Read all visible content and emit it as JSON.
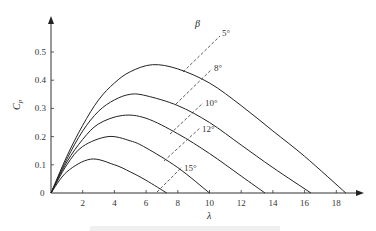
{
  "chart_data": {
    "type": "line",
    "title": "",
    "xlabel": "λ",
    "ylabel": "Cp",
    "xlim": [
      0,
      19.5
    ],
    "ylim": [
      0,
      0.58
    ],
    "grid": false,
    "x_ticks": [
      2,
      4,
      6,
      8,
      10,
      12,
      14,
      16,
      18
    ],
    "x_tick_labels": [
      "2",
      "4",
      "6",
      "8",
      "10",
      "12",
      "14",
      "16",
      "18"
    ],
    "y_ticks": [
      0,
      0.1,
      0.2,
      0.3,
      0.4,
      0.5
    ],
    "y_tick_labels": [
      "0",
      "0.1",
      "0.2",
      "0.3",
      "0.4",
      "0.5"
    ],
    "legend_title": "β",
    "series": [
      {
        "name": "5°",
        "pitch_angle_deg": 5,
        "peak": {
          "x": 6.4,
          "y": 0.455
        },
        "end_x": 18.6,
        "x": [
          0,
          1,
          2,
          3,
          4,
          5,
          6.4,
          8,
          10,
          12,
          14,
          16,
          18.6
        ],
        "values": [
          0,
          0.13,
          0.24,
          0.33,
          0.39,
          0.43,
          0.455,
          0.44,
          0.39,
          0.31,
          0.22,
          0.13,
          0
        ]
      },
      {
        "name": "8°",
        "pitch_angle_deg": 8,
        "peak": {
          "x": 5.0,
          "y": 0.35
        },
        "end_x": 16.4,
        "x": [
          0,
          1,
          2,
          3,
          4,
          5,
          6,
          8,
          10,
          12,
          14,
          16.4
        ],
        "values": [
          0,
          0.12,
          0.22,
          0.29,
          0.33,
          0.35,
          0.345,
          0.31,
          0.25,
          0.17,
          0.09,
          0
        ]
      },
      {
        "name": "10°",
        "pitch_angle_deg": 10,
        "peak": {
          "x": 4.5,
          "y": 0.275
        },
        "end_x": 13.5,
        "x": [
          0,
          1,
          2,
          3,
          4.5,
          6,
          8,
          10,
          12,
          13.5
        ],
        "values": [
          0,
          0.11,
          0.19,
          0.245,
          0.275,
          0.265,
          0.21,
          0.14,
          0.06,
          0
        ]
      },
      {
        "name": "12°",
        "pitch_angle_deg": 12,
        "peak": {
          "x": 3.6,
          "y": 0.2
        },
        "end_x": 10.0,
        "x": [
          0,
          1,
          2,
          3.6,
          5,
          6,
          8,
          10
        ],
        "values": [
          0,
          0.1,
          0.165,
          0.2,
          0.185,
          0.16,
          0.09,
          0
        ]
      },
      {
        "name": "15°",
        "pitch_angle_deg": 15,
        "peak": {
          "x": 2.5,
          "y": 0.12
        },
        "end_x": 7.3,
        "x": [
          0,
          1,
          2.5,
          4,
          5,
          6,
          7.3
        ],
        "values": [
          0,
          0.075,
          0.12,
          0.1,
          0.075,
          0.045,
          0
        ]
      }
    ],
    "annotations": [
      {
        "text": "5°",
        "type": "dashed-leader"
      },
      {
        "text": "8°",
        "type": "dashed-leader"
      },
      {
        "text": "10°",
        "type": "dashed-leader"
      },
      {
        "text": "12°",
        "type": "dashed-leader"
      },
      {
        "text": "15°",
        "type": "dashed-leader"
      }
    ],
    "caption_visible": "(clipped, illegible)"
  },
  "labels": {
    "x_axis": "λ",
    "y_axis_main": "C",
    "y_axis_sub": "p",
    "beta": "β",
    "origin": "0"
  }
}
